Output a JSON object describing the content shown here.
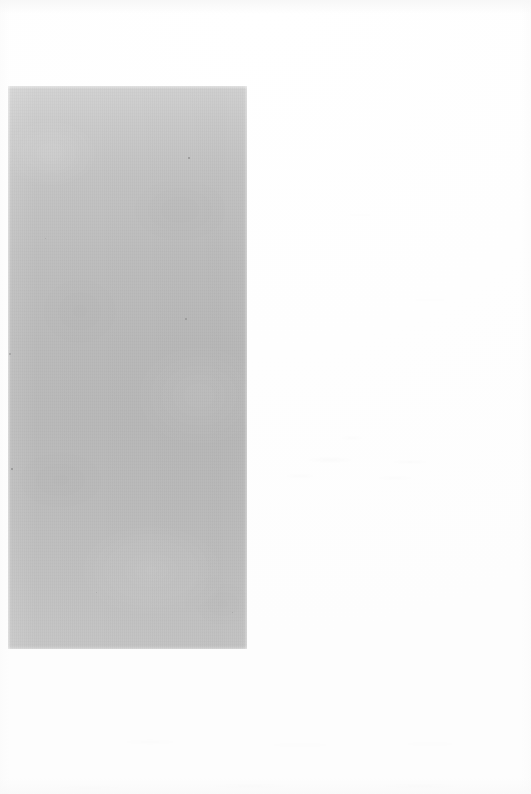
{
  "page": {
    "width": 531,
    "height": 794,
    "background_color": "#ffffff"
  },
  "plate": {
    "name": "blank-gray-plate",
    "x": 8,
    "y": 86,
    "width": 239,
    "height": 563,
    "gradient_top_color": "#d3d3d3",
    "gradient_mid_color": "#b9b9b9",
    "gradient_bottom_color": "#c6c6c6"
  },
  "specks": [
    {
      "x": 188,
      "y": 157,
      "size": 2,
      "color": "#8a8a8a"
    },
    {
      "x": 185,
      "y": 318,
      "size": 2,
      "color": "#8f8f8f"
    },
    {
      "x": 11,
      "y": 468,
      "size": 2,
      "color": "#878787"
    },
    {
      "x": 9,
      "y": 353,
      "size": 2,
      "color": "#9a9a9a"
    },
    {
      "x": 232,
      "y": 612,
      "size": 1,
      "color": "#a0a0a0"
    },
    {
      "x": 96,
      "y": 592,
      "size": 1,
      "color": "#a3a3a3"
    },
    {
      "x": 45,
      "y": 238,
      "size": 1,
      "color": "#a5a5a5"
    }
  ]
}
